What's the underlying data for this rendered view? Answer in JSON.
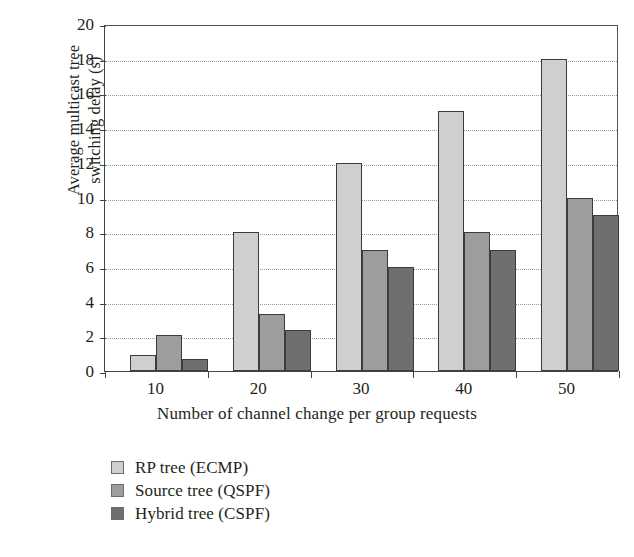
{
  "chart_data": {
    "type": "bar",
    "title": "",
    "xlabel": "Number of channel change per group requests",
    "ylabel_line1": "Average multicast tree",
    "ylabel_line2": "switching delay (s)",
    "ylabel": "Average multicast tree switching delay (s)",
    "categories": [
      "10",
      "20",
      "30",
      "40",
      "50"
    ],
    "xticks": [
      "10",
      "20",
      "30",
      "40",
      "50"
    ],
    "yticks": [
      "0",
      "2",
      "4",
      "6",
      "8",
      "10",
      "12",
      "14",
      "16",
      "18",
      "20"
    ],
    "ylim": [
      0,
      20
    ],
    "ytick_step": 2,
    "grid": "horizontal-dotted",
    "legend_position": "below-left",
    "series": [
      {
        "name": "RP tree (ECMP)",
        "color": "#cfcfcf",
        "values": [
          0.9,
          8.0,
          12.0,
          15.0,
          18.0
        ]
      },
      {
        "name": "Source tree (QSPF)",
        "color": "#9d9d9d",
        "values": [
          2.1,
          3.3,
          7.0,
          8.0,
          10.0
        ]
      },
      {
        "name": "Hybrid tree (CSPF)",
        "color": "#6f6f6f",
        "values": [
          0.7,
          2.35,
          6.0,
          7.0,
          9.0
        ]
      }
    ]
  },
  "colors": {
    "axis": "#444444",
    "grid": "#9a9a9a",
    "text": "#231f20",
    "background": "#ffffff",
    "series1": "#cfcfcf",
    "series2": "#9d9d9d",
    "series3": "#6f6f6f"
  }
}
